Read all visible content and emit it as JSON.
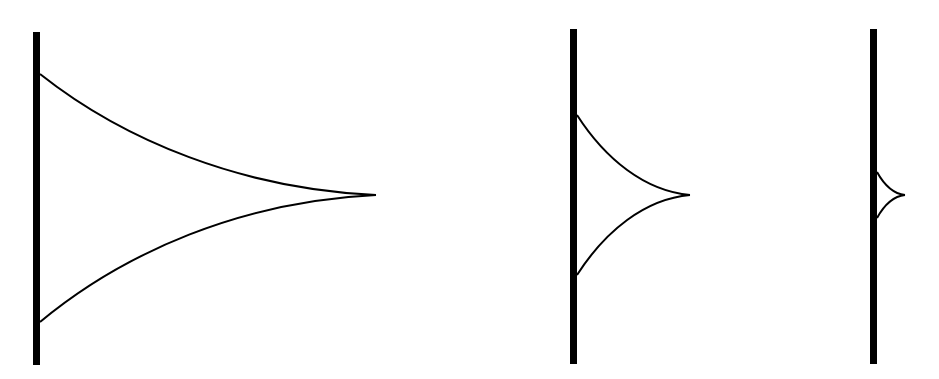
{
  "diagram": {
    "stroke_color": "#000000",
    "background": "#ffffff",
    "shapes": [
      {
        "id": "large",
        "wall": {
          "x": 36.5,
          "y1": 32,
          "y2": 365,
          "width": 7
        },
        "curve": {
          "top_y": 74,
          "bottom_y": 322,
          "tip_x": 376,
          "tip_y": 195
        }
      },
      {
        "id": "medium",
        "wall": {
          "x": 573.5,
          "y1": 29,
          "y2": 364,
          "width": 7
        },
        "curve": {
          "top_y": 115,
          "bottom_y": 275,
          "tip_x": 690,
          "tip_y": 195
        }
      },
      {
        "id": "small",
        "wall": {
          "x": 873.5,
          "y1": 29,
          "y2": 364,
          "width": 7
        },
        "curve": {
          "top_y": 172,
          "bottom_y": 218,
          "tip_x": 905,
          "tip_y": 195
        }
      }
    ]
  }
}
